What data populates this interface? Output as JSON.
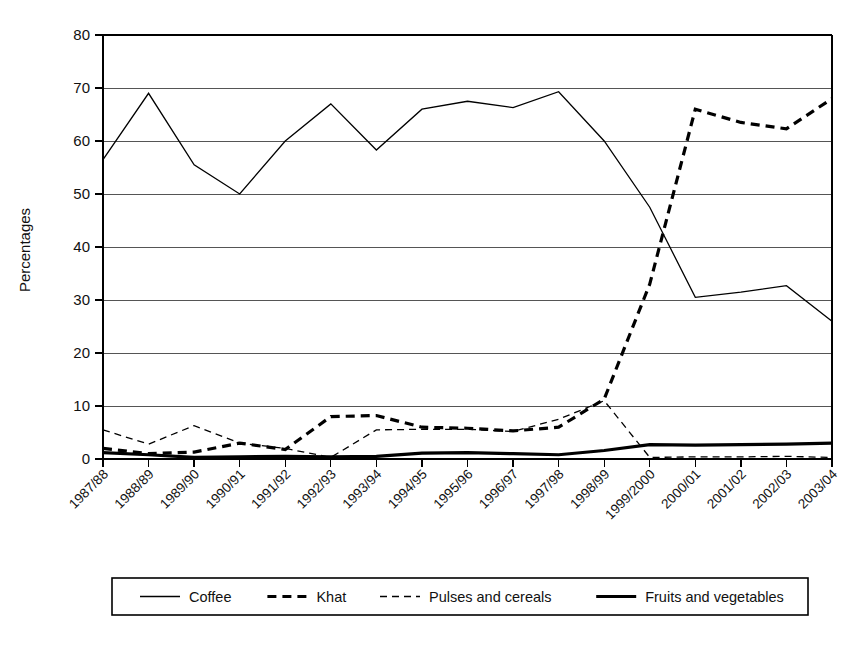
{
  "chart_data": {
    "type": "line",
    "title": "",
    "xlabel": "",
    "ylabel": "Percentages",
    "ylim": [
      0,
      80
    ],
    "ytick_step": 10,
    "yticks": [
      "0",
      "10",
      "20",
      "30",
      "40",
      "50",
      "60",
      "70",
      "80"
    ],
    "grid": true,
    "legend_position": "bottom",
    "categories": [
      "1987/88",
      "1988/89",
      "1989/90",
      "1990/91",
      "1991/92",
      "1992/93",
      "1993/94",
      "1994/95",
      "1995/96",
      "1996/97",
      "1997/98",
      "1998/99",
      "1999/2000",
      "2000/01",
      "2001/02",
      "2002/03",
      "2003/04"
    ],
    "series": [
      {
        "name": "Coffee",
        "style": "thin-solid",
        "values": [
          56.5,
          69.0,
          55.5,
          50.0,
          60.0,
          67.0,
          58.3,
          66.0,
          67.5,
          66.3,
          69.3,
          60.0,
          47.5,
          30.5,
          31.5,
          32.7,
          26.0
        ]
      },
      {
        "name": "Khat",
        "style": "thick-dashed",
        "values": [
          2.0,
          1.0,
          1.3,
          3.0,
          1.8,
          8.0,
          8.2,
          6.0,
          5.8,
          5.3,
          6.0,
          11.3,
          33.0,
          66.0,
          63.5,
          62.3,
          68.0
        ]
      },
      {
        "name": "Pulses and cereals",
        "style": "thin-dashed",
        "values": [
          5.5,
          2.8,
          6.3,
          3.0,
          2.0,
          0.3,
          5.5,
          5.6,
          5.6,
          5.2,
          7.5,
          11.0,
          0.3,
          0.4,
          0.4,
          0.5,
          0.3
        ]
      },
      {
        "name": "Fruits and vegetables",
        "style": "thick-solid",
        "values": [
          1.2,
          0.8,
          0.3,
          0.4,
          0.5,
          0.4,
          0.5,
          1.1,
          1.2,
          1.0,
          0.8,
          1.6,
          2.7,
          2.6,
          2.7,
          2.8,
          3.0
        ]
      }
    ]
  },
  "legend": {
    "items": [
      {
        "label": "Coffee",
        "style": "thin-solid"
      },
      {
        "label": "Khat",
        "style": "thick-dashed"
      },
      {
        "label": "Pulses and cereals",
        "style": "thin-dashed"
      },
      {
        "label": "Fruits and vegetables",
        "style": "thick-solid"
      }
    ]
  },
  "colors": {
    "line": "#000000",
    "grid": "#555555",
    "background": "#ffffff"
  }
}
